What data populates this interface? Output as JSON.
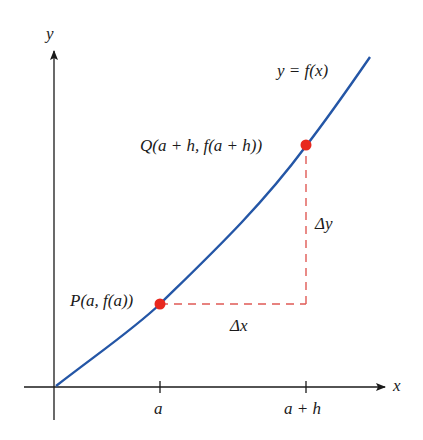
{
  "diagram": {
    "type": "secant-line-increment-diagram",
    "axes": {
      "x_label": "x",
      "y_label": "y",
      "x_ticks": [
        "a",
        "a + h"
      ]
    },
    "curve": {
      "label": "y = f(x)",
      "color": "#2456a6"
    },
    "points": [
      {
        "id": "P",
        "label": "P(a, f(a))",
        "color": "#e8281e"
      },
      {
        "id": "Q",
        "label": "Q(a + h, f(a + h))",
        "color": "#e8281e"
      }
    ],
    "increments": {
      "dx_label": "Δx",
      "dy_label": "Δy",
      "color": "#e05a55"
    }
  }
}
